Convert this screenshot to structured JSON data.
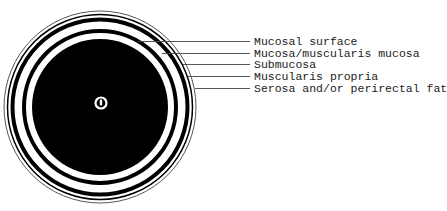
{
  "diagram": {
    "colors": {
      "background": "#ffffff",
      "fill": "#000000",
      "leader_line": "#444444",
      "outer_line": "#555555",
      "text": "#222222"
    },
    "labels": [
      {
        "text": "Mucosal surface",
        "y": 36
      },
      {
        "text": "Mucosa/muscularis mucosa",
        "y": 48
      },
      {
        "text": "Submucosa",
        "y": 59
      },
      {
        "text": "Muscularis propria",
        "y": 71
      },
      {
        "text": "Serosa and/or perirectal fat",
        "y": 83
      }
    ]
  }
}
